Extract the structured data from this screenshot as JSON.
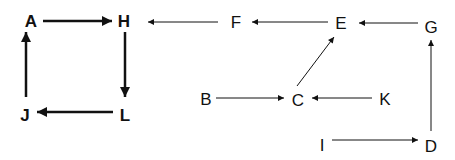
{
  "diagram": {
    "type": "directed-graph",
    "nodes": [
      {
        "id": "A",
        "label": "A",
        "x": 31,
        "y": 21,
        "bold": true
      },
      {
        "id": "H",
        "label": "H",
        "x": 124,
        "y": 21,
        "bold": true
      },
      {
        "id": "J",
        "label": "J",
        "x": 25,
        "y": 115,
        "bold": true
      },
      {
        "id": "L",
        "label": "L",
        "x": 125,
        "y": 115,
        "bold": true
      },
      {
        "id": "F",
        "label": "F",
        "x": 236,
        "y": 22,
        "bold": false
      },
      {
        "id": "E",
        "label": "E",
        "x": 341,
        "y": 23,
        "bold": false
      },
      {
        "id": "G",
        "label": "G",
        "x": 431,
        "y": 27,
        "bold": false
      },
      {
        "id": "B",
        "label": "B",
        "x": 206,
        "y": 99,
        "bold": false
      },
      {
        "id": "C",
        "label": "C",
        "x": 298,
        "y": 100,
        "bold": false
      },
      {
        "id": "K",
        "label": "K",
        "x": 385,
        "y": 99,
        "bold": false
      },
      {
        "id": "I",
        "label": "I",
        "x": 322,
        "y": 145,
        "bold": false
      },
      {
        "id": "D",
        "label": "D",
        "x": 431,
        "y": 146,
        "bold": false
      }
    ],
    "edges": [
      {
        "from": "A",
        "to": "H",
        "bold": true
      },
      {
        "from": "H",
        "to": "L",
        "bold": true
      },
      {
        "from": "L",
        "to": "J",
        "bold": true
      },
      {
        "from": "J",
        "to": "A",
        "bold": true
      },
      {
        "from": "F",
        "to": "H",
        "bold": false
      },
      {
        "from": "E",
        "to": "F",
        "bold": false
      },
      {
        "from": "G",
        "to": "E",
        "bold": false
      },
      {
        "from": "C",
        "to": "E",
        "bold": false
      },
      {
        "from": "B",
        "to": "C",
        "bold": false
      },
      {
        "from": "K",
        "to": "C",
        "bold": false
      },
      {
        "from": "I",
        "to": "D",
        "bold": false
      },
      {
        "from": "D",
        "to": "G",
        "bold": false
      }
    ]
  }
}
